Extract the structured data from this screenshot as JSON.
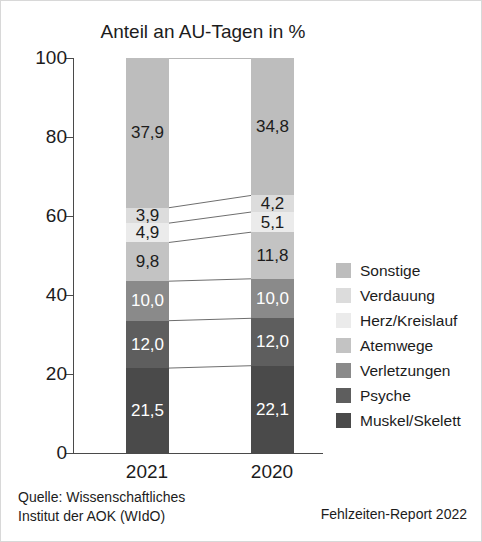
{
  "chart_data": {
    "type": "bar",
    "subtype": "stacked-percentage",
    "title": "Anteil an AU-Tagen in %",
    "xlabel": "",
    "ylabel": "",
    "categories": [
      "2021",
      "2020"
    ],
    "ylim": [
      0,
      100
    ],
    "yticks": [
      0,
      20,
      40,
      60,
      80,
      100
    ],
    "ytick_labels": [
      "0",
      "20",
      "40",
      "60",
      "80",
      "100"
    ],
    "grid": false,
    "legend_position": "right",
    "stack_order_bottom_to_top": [
      "Muskel/Skelett",
      "Psyche",
      "Verletzungen",
      "Atemwege",
      "Herz/Kreislauf",
      "Verdauung",
      "Sonstige"
    ],
    "series": [
      {
        "name": "Muskel/Skelett",
        "color": "#4a4a4a",
        "values": [
          21.5,
          22.1
        ],
        "labels": [
          "21,5",
          "22,1"
        ],
        "label_color": "#ffffff"
      },
      {
        "name": "Psyche",
        "color": "#5e5e5e",
        "values": [
          12.0,
          12.0
        ],
        "labels": [
          "12,0",
          "12,0"
        ],
        "label_color": "#ffffff"
      },
      {
        "name": "Verletzungen",
        "color": "#8a8a8a",
        "values": [
          10.0,
          10.0
        ],
        "labels": [
          "10,0",
          "10,0"
        ],
        "label_color": "#ffffff"
      },
      {
        "name": "Atemwege",
        "color": "#c3c3c3",
        "values": [
          9.8,
          11.8
        ],
        "labels": [
          "9,8",
          "11,8"
        ],
        "label_color": "#1c1c1c"
      },
      {
        "name": "Herz/Kreislauf",
        "color": "#ebebeb",
        "values": [
          4.9,
          5.1
        ],
        "labels": [
          "4,9",
          "5,1"
        ],
        "label_color": "#1c1c1c"
      },
      {
        "name": "Verdauung",
        "color": "#dcdcdc",
        "values": [
          3.9,
          4.2
        ],
        "labels": [
          "3,9",
          "4,2"
        ],
        "label_color": "#1c1c1c"
      },
      {
        "name": "Sonstige",
        "color": "#bdbdbd",
        "values": [
          37.9,
          34.8
        ],
        "labels": [
          "37,9",
          "34,8"
        ],
        "label_color": "#1c1c1c"
      }
    ]
  },
  "legend": {
    "items": [
      {
        "label": "Sonstige",
        "color": "#bdbdbd"
      },
      {
        "label": "Verdauung",
        "color": "#dcdcdc"
      },
      {
        "label": "Herz/Kreislauf",
        "color": "#ebebeb"
      },
      {
        "label": "Atemwege",
        "color": "#c3c3c3"
      },
      {
        "label": "Verletzungen",
        "color": "#8a8a8a"
      },
      {
        "label": "Psyche",
        "color": "#5e5e5e"
      },
      {
        "label": "Muskel/Skelett",
        "color": "#4a4a4a"
      }
    ]
  },
  "footer": {
    "source_line_1": "Quelle: Wissenschaftliches",
    "source_line_2": "Institut der AOK (WIdO)",
    "report": "Fehlzeiten-Report 2022"
  }
}
